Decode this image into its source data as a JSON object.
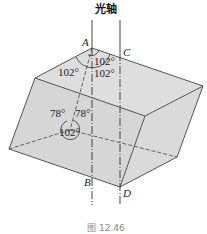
{
  "diagram": {
    "title": "光轴",
    "caption": "图 12.46",
    "vertices": {
      "A": "A",
      "B": "B",
      "C": "C",
      "D": "D"
    },
    "angles": {
      "top_inner": "102°",
      "top_left": "102°",
      "top_right": "102°",
      "hidden_left": "78°",
      "hidden_right": "78°",
      "hidden_bottom": "102°"
    },
    "colors": {
      "face_fill": "#d9d9d9",
      "edge": "#555555",
      "axis": "#333333"
    }
  }
}
